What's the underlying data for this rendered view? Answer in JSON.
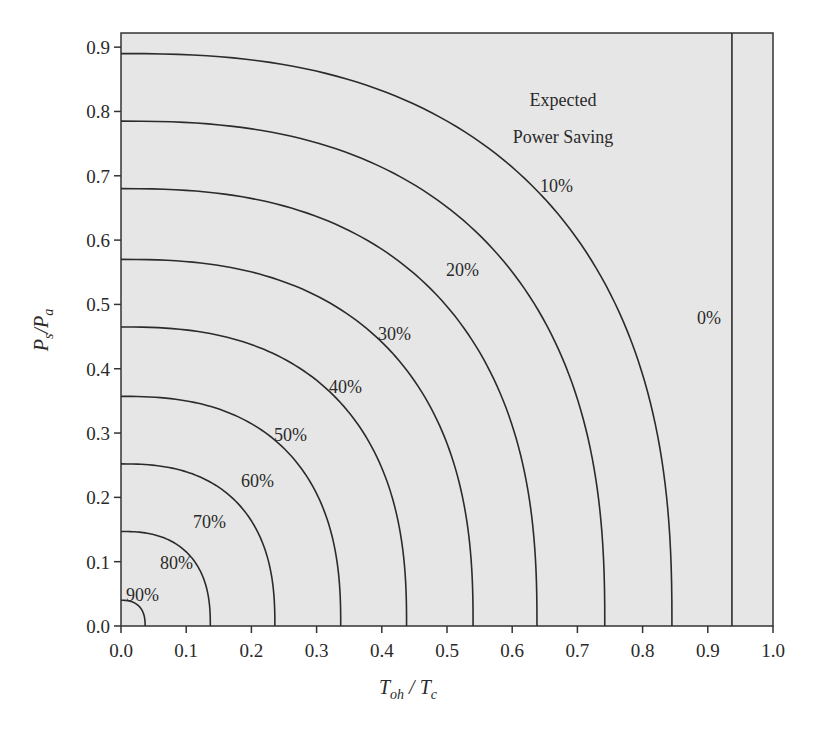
{
  "chart_data": {
    "type": "line",
    "title": "",
    "xlabel": "T_oh / T_c",
    "ylabel": "P_s / P_a",
    "xlim": [
      0.0,
      1.0
    ],
    "ylim": [
      0.0,
      0.92
    ],
    "grid": false,
    "background": "#e6e6e6",
    "x_ticks": [
      "0.0",
      "0.1",
      "0.2",
      "0.3",
      "0.4",
      "0.5",
      "0.6",
      "0.7",
      "0.8",
      "0.9",
      "1.0"
    ],
    "y_ticks": [
      "0.0",
      "0.1",
      "0.2",
      "0.3",
      "0.4",
      "0.5",
      "0.6",
      "0.7",
      "0.8",
      "0.9"
    ],
    "annotation": [
      "Expected",
      "Power Saving"
    ],
    "series": [
      {
        "name": "10%",
        "x_intercept": 0.845,
        "y_intercept": 0.89,
        "points": [
          [
            0.0,
            0.89
          ],
          [
            0.49,
            0.78
          ],
          [
            0.673,
            0.67
          ],
          [
            0.768,
            0.414
          ],
          [
            0.845,
            0.0
          ]
        ]
      },
      {
        "name": "20%",
        "x_intercept": 0.742,
        "y_intercept": 0.785,
        "points": [
          [
            0.0,
            0.785
          ],
          [
            0.742,
            0.0
          ]
        ]
      },
      {
        "name": "30%",
        "x_intercept": 0.638,
        "y_intercept": 0.68,
        "points": [
          [
            0.0,
            0.68
          ],
          [
            0.638,
            0.0
          ]
        ]
      },
      {
        "name": "40%",
        "x_intercept": 0.54,
        "y_intercept": 0.57,
        "points": [
          [
            0.0,
            0.57
          ],
          [
            0.54,
            0.0
          ]
        ]
      },
      {
        "name": "50%",
        "x_intercept": 0.438,
        "y_intercept": 0.465,
        "points": [
          [
            0.0,
            0.465
          ],
          [
            0.438,
            0.0
          ]
        ]
      },
      {
        "name": "60%",
        "x_intercept": 0.337,
        "y_intercept": 0.357,
        "points": [
          [
            0.0,
            0.357
          ],
          [
            0.337,
            0.0
          ]
        ]
      },
      {
        "name": "70%",
        "x_intercept": 0.236,
        "y_intercept": 0.252,
        "points": [
          [
            0.0,
            0.252
          ],
          [
            0.236,
            0.0
          ]
        ]
      },
      {
        "name": "80%",
        "x_intercept": 0.137,
        "y_intercept": 0.147,
        "points": [
          [
            0.0,
            0.147
          ],
          [
            0.137,
            0.0
          ]
        ]
      },
      {
        "name": "90%",
        "x_intercept": 0.037,
        "y_intercept": 0.04,
        "points": [
          [
            0.0,
            0.04
          ],
          [
            0.037,
            0.0
          ]
        ]
      },
      {
        "name": "0%",
        "x_intercept": 0.937,
        "y_intercept": null,
        "points": [
          [
            0.937,
            0.0
          ],
          [
            0.937,
            0.92
          ]
        ]
      }
    ]
  },
  "labels": {
    "curves": [
      {
        "text": "90%",
        "x": 126,
        "y": 601
      },
      {
        "text": "80%",
        "x": 160,
        "y": 569
      },
      {
        "text": "70%",
        "x": 193,
        "y": 528
      },
      {
        "text": "60%",
        "x": 241,
        "y": 487
      },
      {
        "text": "50%",
        "x": 274,
        "y": 441
      },
      {
        "text": "40%",
        "x": 329,
        "y": 393
      },
      {
        "text": "30%",
        "x": 378,
        "y": 340
      },
      {
        "text": "20%",
        "x": 446,
        "y": 276
      },
      {
        "text": "10%",
        "x": 540,
        "y": 192
      },
      {
        "text": "0%",
        "x": 697,
        "y": 324
      }
    ],
    "annotation_line1": "Expected",
    "annotation_line2": "Power Saving",
    "xlabel_main_1": "T",
    "xlabel_sub_1": "oh",
    "xlabel_sep": " / ",
    "xlabel_main_2": "T",
    "xlabel_sub_2": "c",
    "ylabel_main_1": "P",
    "ylabel_sub_1": "s",
    "ylabel_sep": "/",
    "ylabel_main_2": "P",
    "ylabel_sub_2": "a"
  },
  "layout": {
    "plot_left": 121,
    "plot_right": 773,
    "plot_top": 33,
    "plot_bottom": 626,
    "y_max_value": 0.922,
    "superellipse_exponent": 2.5
  }
}
